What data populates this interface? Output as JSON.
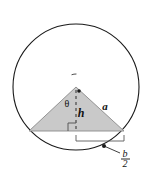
{
  "figure": {
    "caption_fragment": "circle.",
    "background_color": "#ffffff"
  },
  "colors": {
    "circle_stroke": "#1a1a1a",
    "triangle_fill": "#c9c9c9",
    "triangle_stroke": "#8a8a8a",
    "label_text": "#111111",
    "caption_text": "#6d6d6d",
    "dimension_line": "#5a5a5a",
    "height_line": "#3a3a3a"
  },
  "shapes": {
    "circle": {
      "name": "circumscribed-circle",
      "cx": 76,
      "cy": 87,
      "r": 63,
      "stroke_width": 1.1
    },
    "triangle": {
      "name": "inscribed-triangle",
      "apex_x": 76,
      "apex_y": 87,
      "left_x": 29,
      "left_y": 131,
      "right_x": 124,
      "right_y": 131
    },
    "height_line": {
      "name": "height-dashed-line",
      "x": 76,
      "y_top": 90,
      "y_bottom": 131,
      "dash": "3 3"
    },
    "right_angle_marker": {
      "name": "right-angle-marker",
      "x": 76,
      "y": 131,
      "size": 8
    },
    "apex_dot": {
      "cx": 79,
      "cy": 91,
      "r": 1.8
    },
    "leader_dot": {
      "cx": 104,
      "cy": 146,
      "r": 2.0
    },
    "dimension_bracket": {
      "name": "half-base-dimension",
      "x_start": 76,
      "x_end": 124,
      "y": 141,
      "tick_height": 6
    },
    "leader_line": {
      "x1": 104,
      "y1": 146,
      "x2": 120,
      "y2": 153
    },
    "theta_arc": {
      "cx": 76,
      "cy": 87,
      "r": 13,
      "start_deg": 250,
      "end_deg": 272
    }
  },
  "labels": {
    "theta": {
      "text": "θ",
      "x": 67,
      "y": 107,
      "font_size": 10
    },
    "height": {
      "text": "h",
      "x": 81,
      "y": 117,
      "font_size": 12
    },
    "side": {
      "text": "a",
      "x": 105,
      "y": 110,
      "font_size": 11
    },
    "half_base_numerator": {
      "text": "b",
      "x": 125,
      "y": 157,
      "font_size": 10
    },
    "half_base_denominator": {
      "text": "2",
      "x": 125,
      "y": 167,
      "font_size": 10
    },
    "fraction_bar": {
      "x1": 121,
      "x2": 130,
      "y": 159
    }
  }
}
